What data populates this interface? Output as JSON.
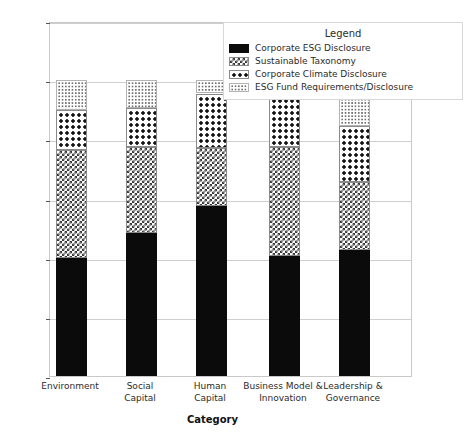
{
  "chart_data": {
    "type": "bar",
    "subtype": "stacked-bar",
    "title": "",
    "xlabel": "Category",
    "ylabel": "Proportion of regulations by type",
    "ylim": [
      0.0,
      1.2
    ],
    "yticks": [
      "0.0",
      "0.2",
      "0.4",
      "0.6",
      "0.8",
      "1.0",
      "1.2"
    ],
    "ytick_values": [
      0.0,
      0.2,
      0.4,
      0.6,
      0.8,
      1.0,
      1.2
    ],
    "grid": true,
    "legend_position": "upper right",
    "legend_title": "Legend",
    "categories": [
      "Environment",
      "Social Capital",
      "Human Capital",
      "Business Model & Innovation",
      "Leadership & Governance"
    ],
    "category_lines": [
      [
        "Environment"
      ],
      [
        "Social",
        "Capital"
      ],
      [
        "Human",
        "Capital"
      ],
      [
        "Business Model &",
        "Innovation"
      ],
      [
        "Leadership &",
        "Governance"
      ]
    ],
    "series": [
      {
        "name": "Corporate ESG Disclosure",
        "pattern": "solid-black",
        "color": "#0b0b0b",
        "values": [
          0.4,
          0.485,
          0.575,
          0.405,
          0.425
        ]
      },
      {
        "name": "Sustainable Taxonomy",
        "pattern": "cross-hatch",
        "color": "#ffffff",
        "values": [
          0.365,
          0.29,
          0.195,
          0.37,
          0.23
        ]
      },
      {
        "name": "Corporate Climate Disclosure",
        "pattern": "bold-dots",
        "color": "#ffffff",
        "values": [
          0.135,
          0.13,
          0.185,
          0.192,
          0.19
        ]
      },
      {
        "name": "ESG Fund Requirements/Disclosure",
        "pattern": "fine-dots",
        "color": "#ffffff",
        "values": [
          0.1,
          0.095,
          0.045,
          0.033,
          0.155
        ]
      }
    ],
    "totals": [
      1.0,
      1.0,
      1.0,
      1.0,
      1.0
    ]
  },
  "legend": {
    "title": "Legend",
    "entries": [
      {
        "label": "Corporate ESG Disclosure",
        "swatch": "solid-black-swatch"
      },
      {
        "label": "Sustainable Taxonomy",
        "swatch": "cross-hatch-swatch"
      },
      {
        "label": "Corporate Climate Disclosure",
        "swatch": "bold-dots-swatch"
      },
      {
        "label": "ESG Fund Requirements/Disclosure",
        "swatch": "fine-dots-swatch"
      }
    ]
  }
}
